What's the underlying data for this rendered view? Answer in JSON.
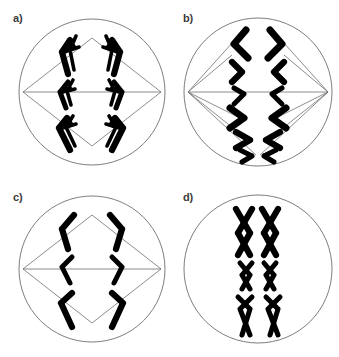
{
  "figure": {
    "type": "cell-division-stages-diagram",
    "background_color": "#ffffff",
    "panel_count": 4,
    "grid": "2x2"
  },
  "style": {
    "membrane_stroke": "#6e6e6e",
    "spindle_stroke": "#6e6e6e",
    "chromosome_color": "#000000",
    "label_color": "#3b3b3b"
  },
  "panels": [
    {
      "id": "a",
      "label": "a)",
      "position": "top-left",
      "cell": {
        "cx": 92,
        "cy": 92,
        "r": 73
      },
      "spindle": {
        "left_pole": {
          "x": 23,
          "y": 92
        },
        "right_pole": {
          "x": 161,
          "y": 92
        },
        "shape": "diamond",
        "fiber_count": 5
      },
      "chromosome_count": 6,
      "chromosome_group_left": 3,
      "chromosome_group_right": 3,
      "chromosome_form": "double-chromatid-v-shaped"
    },
    {
      "id": "b",
      "label": "b)",
      "position": "top-right",
      "cell": {
        "cx": 88,
        "cy": 92,
        "r": 74
      },
      "spindle": {
        "left_pole": {
          "x": 18,
          "y": 92
        },
        "right_pole": {
          "x": 158,
          "y": 92
        },
        "shape": "fanned-diamond",
        "fiber_count": 12
      },
      "chromosome_count": 12,
      "chromosome_group_left": 6,
      "chromosome_group_right": 6,
      "chromosome_form": "thick-chevron-separating"
    },
    {
      "id": "c",
      "label": "c)",
      "position": "bottom-left",
      "cell": {
        "cx": 92,
        "cy": 90,
        "r": 73
      },
      "spindle": {
        "left_pole": {
          "x": 23,
          "y": 90
        },
        "right_pole": {
          "x": 161,
          "y": 90
        },
        "shape": "diamond",
        "fiber_count": 5
      },
      "chromosome_count": 6,
      "chromosome_group_left": 3,
      "chromosome_group_right": 3,
      "chromosome_form": "single-bent-chromatid"
    },
    {
      "id": "d",
      "label": "d)",
      "position": "bottom-right",
      "cell": {
        "cx": 88,
        "cy": 90,
        "r": 74
      },
      "spindle": null,
      "chromosome_count": 6,
      "chromosome_pairs": 3,
      "chromosome_form": "x-shaped-condensed",
      "pair_sizes": [
        "large",
        "small",
        "acrocentric"
      ]
    }
  ]
}
